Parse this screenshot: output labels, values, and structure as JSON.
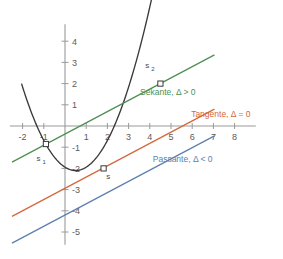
{
  "chart_data": {
    "type": "line",
    "title": "",
    "xlabel": "",
    "ylabel": "",
    "xlim": [
      -2.6,
      9.0
    ],
    "ylim": [
      -5.6,
      4.8
    ],
    "grid": false,
    "legend_position": "inline-right",
    "axis_color": "#9a9a9a",
    "background": "#ffffff",
    "x_ticks": [
      "-2",
      "-1",
      "1",
      "2",
      "3",
      "4",
      "5",
      "6",
      "7",
      "8"
    ],
    "x_tick_values": [
      -2,
      -1,
      1,
      2,
      3,
      4,
      5,
      6,
      7,
      8
    ],
    "y_ticks": [
      "4",
      "3",
      "2",
      "1",
      "-1",
      "-2",
      "-3",
      "-4",
      "-5"
    ],
    "y_tick_values": [
      4,
      3,
      2,
      1,
      -1,
      -2,
      -3,
      -4,
      -5
    ],
    "series": [
      {
        "name": "parabola",
        "kind": "quadratic",
        "color": "#3a3a3a",
        "equation_a": 0.63,
        "equation_h": 0.5,
        "equation_k": -2.1,
        "x_start": -2.05,
        "x_end": 5.6
      },
      {
        "name": "Sekante",
        "kind": "linear",
        "color": "#4e8f52",
        "slope": 0.53,
        "intercept": -0.38,
        "x_start": -2.5,
        "x_end": 7.05
      },
      {
        "name": "Tangente",
        "kind": "linear",
        "color": "#d4673c",
        "slope": 0.53,
        "intercept": -2.94,
        "x_start": -2.5,
        "x_end": 7.05
      },
      {
        "name": "Passante",
        "kind": "linear",
        "color": "#5d7fae",
        "slope": 0.53,
        "intercept": -4.2,
        "x_start": -2.5,
        "x_end": 7.05
      }
    ],
    "annotations": [
      {
        "name": "sekante-label",
        "text": "Sekante, Δ > 0",
        "color": "#4e8f52",
        "x": 4.85,
        "y": 1.45
      },
      {
        "name": "tangente-label",
        "text": "Tangente, Δ = 0",
        "color": "#d4673c",
        "x": 7.35,
        "y": 0.42
      },
      {
        "name": "passante-label",
        "text": "Passante, Δ < 0",
        "color": "#5d7fae",
        "x": 5.55,
        "y": -1.72
      }
    ],
    "points": [
      {
        "name": "s1",
        "label": "s",
        "subscript": "1",
        "x": -0.9,
        "y": -0.85,
        "label_dx": -0.35,
        "label_dy": -0.78
      },
      {
        "name": "s",
        "label": "s",
        "subscript": "",
        "x": 1.82,
        "y": -2.0,
        "label_dx": 0.22,
        "label_dy": -0.52
      },
      {
        "name": "s2",
        "label": "s",
        "subscript": "2",
        "x": 4.5,
        "y": 2.0,
        "label_dx": -0.62,
        "label_dy": 0.72
      }
    ]
  }
}
